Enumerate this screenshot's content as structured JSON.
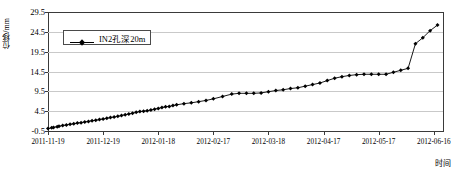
{
  "chart_data": {
    "type": "line",
    "title": "",
    "subtitle": "",
    "xlabel": "时间",
    "ylabel": "位移/mm",
    "ylim": [
      -0.5,
      29.5
    ],
    "yticks": [
      -0.5,
      4.5,
      9.5,
      14.5,
      19.5,
      24.5,
      29.5
    ],
    "ytick_labels": [
      "-0.5",
      "4.5",
      "9.5",
      "14.5",
      "19.5",
      "24.5",
      "29.5"
    ],
    "xticks": [
      0,
      30,
      60,
      90,
      120,
      150,
      180,
      210
    ],
    "xtick_labels": [
      "2011-11-19",
      "2011-12-19",
      "2012-01-18",
      "2012-02-17",
      "2012-03-18",
      "2012-04-17",
      "2012-05-17",
      "2012-06-16"
    ],
    "xlim": [
      0,
      215
    ],
    "grid": true,
    "grid_axis": "y",
    "legend_position": "upper-left-inside",
    "marker": "diamond",
    "line_color": "#000000",
    "marker_color": "#000000",
    "series": [
      {
        "name": "IN2孔深20m",
        "x": [
          0,
          2,
          3,
          5,
          6,
          8,
          10,
          12,
          14,
          16,
          18,
          20,
          22,
          24,
          26,
          28,
          30,
          32,
          34,
          36,
          38,
          40,
          42,
          44,
          46,
          48,
          50,
          52,
          54,
          56,
          58,
          60,
          62,
          64,
          66,
          68,
          70,
          74,
          78,
          82,
          86,
          90,
          95,
          100,
          104,
          108,
          112,
          116,
          120,
          124,
          128,
          132,
          136,
          140,
          144,
          148,
          152,
          156,
          160,
          164,
          168,
          172,
          176,
          180,
          184,
          188,
          192,
          196,
          200,
          204,
          208,
          212
        ],
        "values": [
          0.1,
          0.3,
          0.4,
          0.6,
          0.7,
          0.9,
          1.0,
          1.2,
          1.3,
          1.5,
          1.6,
          1.8,
          1.9,
          2.1,
          2.2,
          2.4,
          2.5,
          2.7,
          2.9,
          3.0,
          3.2,
          3.4,
          3.6,
          3.8,
          4.0,
          4.2,
          4.4,
          4.5,
          4.6,
          4.8,
          5.0,
          5.2,
          5.4,
          5.6,
          5.7,
          5.9,
          6.1,
          6.4,
          6.6,
          6.9,
          7.2,
          7.6,
          8.2,
          8.8,
          9.0,
          9.0,
          9.0,
          9.1,
          9.4,
          9.7,
          9.9,
          10.2,
          10.4,
          10.8,
          11.2,
          11.6,
          12.2,
          12.8,
          13.2,
          13.5,
          13.7,
          13.8,
          13.8,
          13.8,
          13.8,
          14.3,
          14.8,
          15.3,
          21.5,
          23.0,
          24.8,
          26.2
        ]
      }
    ]
  },
  "legend": {
    "entries": [
      {
        "label": "IN2孔深20m",
        "marker": "diamond",
        "color": "#000000"
      }
    ]
  },
  "axes": {
    "y_title": "位移/mm",
    "x_title": "时间"
  }
}
